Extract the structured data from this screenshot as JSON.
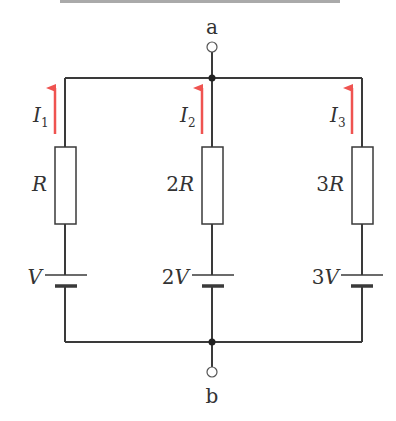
{
  "colors": {
    "wire": "#3a3a3a",
    "arrow": "#ef5350",
    "background": "#ffffff"
  },
  "terminals": {
    "top": "a",
    "bottom": "b"
  },
  "branches": [
    {
      "current": "I",
      "current_sub": "1",
      "resistor": "R",
      "resistor_coef": "",
      "battery": "V",
      "battery_coef": ""
    },
    {
      "current": "I",
      "current_sub": "2",
      "resistor": "R",
      "resistor_coef": "2",
      "battery": "V",
      "battery_coef": "2"
    },
    {
      "current": "I",
      "current_sub": "3",
      "resistor": "R",
      "resistor_coef": "3",
      "battery": "V",
      "battery_coef": "3"
    }
  ]
}
